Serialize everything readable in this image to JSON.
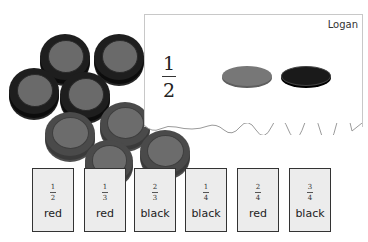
{
  "scene": {
    "coin_pile": {
      "black_coins": [
        {
          "x": 40,
          "y": 34,
          "size": 50
        },
        {
          "x": 94,
          "y": 34,
          "size": 50
        },
        {
          "x": 9,
          "y": 68,
          "size": 50
        },
        {
          "x": 60,
          "y": 72,
          "size": 50
        }
      ],
      "red_coins": [
        {
          "x": 45,
          "y": 112,
          "size": 50
        },
        {
          "x": 100,
          "y": 102,
          "size": 50
        },
        {
          "x": 85,
          "y": 140,
          "size": 48
        },
        {
          "x": 140,
          "y": 130,
          "size": 50
        }
      ]
    },
    "paper": {
      "name": "Logan",
      "fraction": {
        "numerator": "1",
        "denominator": "2"
      },
      "coins": [
        "red",
        "black"
      ]
    },
    "cards": [
      {
        "numerator": "1",
        "denominator": "2",
        "color": "red",
        "x": 32
      },
      {
        "numerator": "1",
        "denominator": "3",
        "color": "red",
        "x": 84
      },
      {
        "numerator": "2",
        "denominator": "3",
        "color": "black",
        "x": 134
      },
      {
        "numerator": "1",
        "denominator": "4",
        "color": "black",
        "x": 185
      },
      {
        "numerator": "2",
        "denominator": "4",
        "color": "red",
        "x": 237
      },
      {
        "numerator": "3",
        "denominator": "4",
        "color": "black",
        "x": 289
      }
    ]
  }
}
